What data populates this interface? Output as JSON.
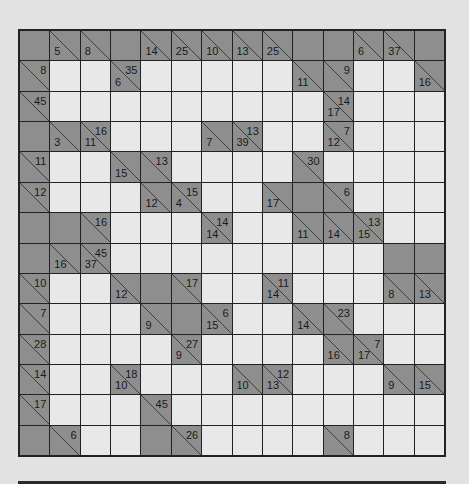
{
  "puzzle": {
    "type": "kakuro",
    "rows": 14,
    "cols": 14,
    "colors": {
      "block": "#8e8e8e",
      "entry": "#e8e8e8",
      "border": "#222222",
      "page": "#e2e2e2"
    },
    "legend": "B = blank block; W = empty entry cell; [across, down] = clue cell (null = none)",
    "grid": [
      [
        "B",
        [
          null,
          5
        ],
        [
          null,
          8
        ],
        "B",
        [
          null,
          14
        ],
        [
          null,
          25
        ],
        [
          null,
          10
        ],
        [
          null,
          13
        ],
        [
          null,
          25
        ],
        "B",
        "B",
        [
          null,
          6
        ],
        [
          null,
          37
        ],
        "B"
      ],
      [
        [
          8,
          null
        ],
        "W",
        "W",
        [
          35,
          6
        ],
        "W",
        "W",
        "W",
        "W",
        "W",
        [
          null,
          11
        ],
        [
          9,
          null
        ],
        "W",
        "W",
        [
          null,
          16
        ]
      ],
      [
        [
          45,
          null
        ],
        "W",
        "W",
        "W",
        "W",
        "W",
        "W",
        "W",
        "W",
        "W",
        [
          14,
          17
        ],
        "W",
        "W",
        "W"
      ],
      [
        "B",
        [
          null,
          3
        ],
        [
          16,
          11
        ],
        "W",
        "W",
        "W",
        [
          null,
          7
        ],
        [
          13,
          39
        ],
        "W",
        "W",
        [
          7,
          12
        ],
        "W",
        "W",
        "W"
      ],
      [
        [
          11,
          null
        ],
        "W",
        "W",
        [
          null,
          15
        ],
        [
          13,
          null
        ],
        "W",
        "W",
        "W",
        "W",
        [
          30,
          null
        ],
        "W",
        "W",
        "W",
        "W"
      ],
      [
        [
          12,
          null
        ],
        "W",
        "W",
        "W",
        [
          null,
          12
        ],
        [
          15,
          4
        ],
        "W",
        "W",
        [
          null,
          17
        ],
        "B",
        [
          6,
          null
        ],
        "W",
        "W",
        "W"
      ],
      [
        "B",
        "B",
        [
          16,
          null
        ],
        "W",
        "W",
        "W",
        [
          14,
          14
        ],
        "W",
        "W",
        [
          null,
          11
        ],
        [
          null,
          14
        ],
        [
          13,
          15
        ],
        "W",
        "W"
      ],
      [
        "B",
        [
          null,
          16
        ],
        [
          45,
          37
        ],
        "W",
        "W",
        "W",
        "W",
        "W",
        "W",
        "W",
        "W",
        "W",
        "B",
        "B"
      ],
      [
        [
          10,
          null
        ],
        "W",
        "W",
        [
          null,
          12
        ],
        "B",
        [
          17,
          null
        ],
        "W",
        "W",
        [
          11,
          14
        ],
        "W",
        "W",
        "W",
        [
          null,
          8
        ],
        [
          null,
          13
        ]
      ],
      [
        [
          7,
          null
        ],
        "W",
        "W",
        "W",
        [
          null,
          9
        ],
        "B",
        [
          6,
          15
        ],
        "W",
        "W",
        [
          null,
          14
        ],
        [
          23,
          null
        ],
        "W",
        "W",
        "W"
      ],
      [
        [
          28,
          null
        ],
        "W",
        "W",
        "W",
        "W",
        [
          27,
          9
        ],
        "W",
        "W",
        "W",
        "W",
        [
          null,
          16
        ],
        [
          7,
          17
        ],
        "W",
        "W"
      ],
      [
        [
          14,
          null
        ],
        "W",
        "W",
        [
          18,
          10
        ],
        "W",
        "W",
        "W",
        [
          null,
          10
        ],
        [
          12,
          13
        ],
        "W",
        "W",
        "W",
        [
          null,
          9
        ],
        [
          null,
          15
        ]
      ],
      [
        [
          17,
          null
        ],
        "W",
        "W",
        "W",
        [
          45,
          null
        ],
        "W",
        "W",
        "W",
        "W",
        "W",
        "W",
        "W",
        "W",
        "W"
      ],
      [
        "B",
        [
          6,
          null
        ],
        "W",
        "W",
        "B",
        [
          26,
          null
        ],
        "W",
        "W",
        "W",
        "W",
        [
          8,
          null
        ],
        "W",
        "W",
        "W"
      ]
    ]
  }
}
